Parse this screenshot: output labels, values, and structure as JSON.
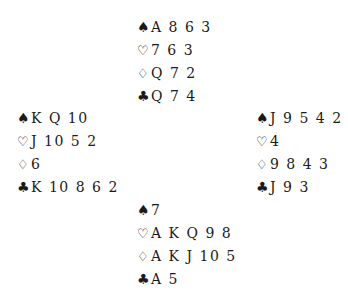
{
  "diagram": {
    "type": "bridge-deal",
    "symbols": {
      "spades": "♠",
      "hearts": "♡",
      "diamonds": "♢",
      "clubs": "♣"
    },
    "hands": {
      "north": {
        "spades": "A 8 6 3",
        "hearts": "7 6 3",
        "diamonds": "Q 7 2",
        "clubs": "Q 7 4"
      },
      "west": {
        "spades": "K Q 10",
        "hearts": "J 10 5 2",
        "diamonds": "6",
        "clubs": "K 10 8 6 2"
      },
      "east": {
        "spades": "J 9 5 4 2",
        "hearts": "4",
        "diamonds": "9 8 4 3",
        "clubs": "J 9 3"
      },
      "south": {
        "spades": "7",
        "hearts": "A K Q 9 8",
        "diamonds": "A K J 10 5",
        "clubs": "A 5"
      }
    }
  }
}
